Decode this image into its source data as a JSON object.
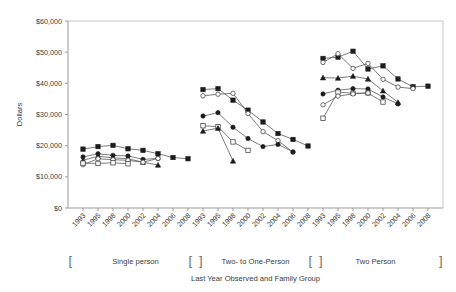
{
  "chart_data": {
    "type": "line",
    "title": "",
    "xlabel": "Last Year Observed and Family Group",
    "ylabel": "Dollars",
    "ylim": [
      0,
      60000
    ],
    "ytick_labels": [
      "$0",
      "$10,000",
      "$20,000",
      "$30,000",
      "$40,000",
      "$50,000",
      "$60,000"
    ],
    "ytick_values": [
      0,
      10000,
      20000,
      30000,
      40000,
      50000,
      60000
    ],
    "grid": false,
    "legend": "none",
    "categories": [
      "1993",
      "1995",
      "1998",
      "2000",
      "2002",
      "2004",
      "2006",
      "2008"
    ],
    "groups": [
      {
        "name": "Single person",
        "bracket_open": "[",
        "bracket_close": "]",
        "series": [
          {
            "name": "series-1-filled-square",
            "marker": "filled-square",
            "x": [
              "1993",
              "1995",
              "1998",
              "2000",
              "2002",
              "2004",
              "2006",
              "2008"
            ],
            "values": [
              18900,
              19700,
              20100,
              19000,
              18500,
              17400,
              16200,
              15800
            ]
          },
          {
            "name": "series-2-filled-circle",
            "marker": "filled-circle",
            "x": [
              "1993",
              "1995",
              "1998",
              "2000",
              "2002",
              "2004"
            ],
            "values": [
              16400,
              17400,
              16900,
              16700,
              15600,
              15900
            ]
          },
          {
            "name": "series-3-filled-triangle",
            "marker": "filled-triangle",
            "x": [
              "1993",
              "1995",
              "1998",
              "2000",
              "2002",
              "2004"
            ],
            "values": [
              15300,
              16600,
              16100,
              15800,
              14700,
              13800
            ]
          },
          {
            "name": "series-4-open-circle",
            "marker": "open-circle",
            "x": [
              "1993",
              "1995",
              "1998",
              "2000",
              "2002",
              "2004"
            ],
            "values": [
              13900,
              15800,
              15500,
              15300,
              14700,
              15900
            ]
          },
          {
            "name": "series-5-open-square",
            "marker": "open-square",
            "x": [
              "1993",
              "1995",
              "1998",
              "2000"
            ],
            "values": [
              14400,
              14300,
              14500,
              14200
            ]
          }
        ]
      },
      {
        "name": "Two- to One-Person",
        "bracket_open": "[",
        "bracket_close": "]",
        "series": [
          {
            "name": "series-1-filled-square",
            "marker": "filled-square",
            "x": [
              "1993",
              "1995",
              "1998",
              "2000",
              "2002",
              "2004",
              "2006",
              "2008"
            ],
            "values": [
              38000,
              38300,
              34600,
              31400,
              27600,
              23900,
              22000,
              19900
            ]
          },
          {
            "name": "series-2-open-circle",
            "marker": "open-circle",
            "x": [
              "1993",
              "1995",
              "1998",
              "2000",
              "2002",
              "2004",
              "2006"
            ],
            "values": [
              36000,
              36500,
              36800,
              30300,
              24500,
              21600,
              17900
            ]
          },
          {
            "name": "series-3-filled-circle",
            "marker": "filled-circle",
            "x": [
              "1993",
              "1995",
              "1998",
              "2000",
              "2002",
              "2004",
              "2006"
            ],
            "values": [
              29500,
              30600,
              25900,
              22300,
              19700,
              20400,
              18000
            ]
          },
          {
            "name": "series-4-open-square",
            "marker": "open-square",
            "x": [
              "1993",
              "1995",
              "1998",
              "2000"
            ],
            "values": [
              26400,
              26100,
              21200,
              18500
            ]
          },
          {
            "name": "series-5-filled-triangle",
            "marker": "filled-triangle",
            "x": [
              "1993",
              "1995",
              "1998"
            ],
            "values": [
              24700,
              25600,
              15100
            ]
          }
        ]
      },
      {
        "name": "Two Person",
        "bracket_open": "[",
        "bracket_close": "]",
        "series": [
          {
            "name": "series-1-filled-square",
            "marker": "filled-square",
            "x": [
              "1993",
              "1995",
              "1998",
              "2000",
              "2002",
              "2004",
              "2006",
              "2008"
            ],
            "values": [
              48000,
              48400,
              50300,
              44600,
              45600,
              41400,
              38900,
              39100
            ]
          },
          {
            "name": "series-2-open-circle",
            "marker": "open-circle",
            "x": [
              "1993",
              "1995",
              "1998",
              "2000",
              "2002",
              "2004",
              "2006"
            ],
            "values": [
              46700,
              49500,
              44800,
              46400,
              41300,
              38800,
              38300
            ]
          },
          {
            "name": "series-3-filled-triangle",
            "marker": "filled-triangle",
            "x": [
              "1993",
              "1995",
              "1998",
              "2000",
              "2002",
              "2004"
            ],
            "values": [
              41800,
              41700,
              42300,
              41400,
              37600,
              33900
            ]
          },
          {
            "name": "series-4-filled-circle",
            "marker": "filled-circle",
            "x": [
              "1993",
              "1995",
              "1998",
              "2000",
              "2002",
              "2004"
            ],
            "values": [
              36600,
              37800,
              38300,
              38200,
              35600,
              33400
            ]
          },
          {
            "name": "series-5-open-square",
            "marker": "open-square",
            "x": [
              "1993",
              "1995",
              "1998",
              "2000",
              "2002"
            ],
            "values": [
              28800,
              37200,
              36800,
              36900,
              34000
            ]
          },
          {
            "name": "series-6-open-diamond",
            "marker": "open-circle",
            "x": [
              "1993",
              "1995",
              "1998",
              "2000"
            ],
            "values": [
              33100,
              35900,
              36600,
              36900
            ]
          }
        ]
      }
    ]
  }
}
